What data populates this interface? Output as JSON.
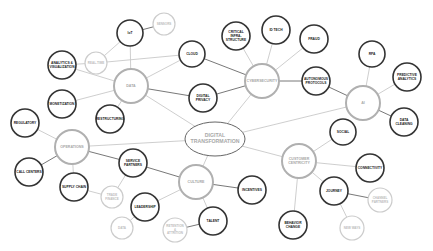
{
  "diagram": {
    "colors": {
      "dark_stroke": "#333333",
      "hub_stroke": "#b0b0b0",
      "light_stroke": "#cccccc",
      "dark_text": "#222222",
      "hub_text": "#a8a8a8",
      "light_text": "#bdbdbd",
      "edge": "#c8c8c8",
      "edge_dark": "#555555"
    },
    "center": {
      "id": "center",
      "label": [
        "DIGITAL",
        "TRANSFORMATION"
      ],
      "x": 215,
      "y": 139,
      "rx": 30,
      "ry": 17
    },
    "nodes": [
      {
        "id": "data",
        "label": [
          "DATA"
        ],
        "x": 131,
        "y": 86,
        "r": 17,
        "kind": "hub"
      },
      {
        "id": "cyber",
        "label": [
          "CYBERSECURITY"
        ],
        "x": 262,
        "y": 81,
        "r": 17,
        "kind": "hub"
      },
      {
        "id": "ai",
        "label": [
          "AI"
        ],
        "x": 363,
        "y": 103,
        "r": 17,
        "kind": "hub"
      },
      {
        "id": "ops",
        "label": [
          "OPERATIONS"
        ],
        "x": 72,
        "y": 147,
        "r": 17,
        "kind": "hub"
      },
      {
        "id": "culture",
        "label": [
          "CULTURE"
        ],
        "x": 196,
        "y": 182,
        "r": 17,
        "kind": "hub"
      },
      {
        "id": "cust",
        "label": [
          "CUSTOMER",
          "CENTRICITY"
        ],
        "x": 299,
        "y": 161,
        "r": 17,
        "kind": "hub"
      },
      {
        "id": "iot",
        "label": [
          "IoT"
        ],
        "x": 130,
        "y": 33,
        "r": 13,
        "kind": "dark"
      },
      {
        "id": "sensors",
        "label": [
          "SENSORS"
        ],
        "x": 164,
        "y": 24,
        "r": 11,
        "kind": "light"
      },
      {
        "id": "realtime",
        "label": [
          "REAL-TIME"
        ],
        "x": 96,
        "y": 63,
        "r": 11,
        "kind": "light"
      },
      {
        "id": "analytics",
        "label": [
          "ANALYTICS &",
          "VISUALIZATION"
        ],
        "x": 62,
        "y": 65,
        "r": 14,
        "kind": "dark"
      },
      {
        "id": "monet",
        "label": [
          "MONETIZATION"
        ],
        "x": 62,
        "y": 104,
        "r": 14,
        "kind": "dark"
      },
      {
        "id": "restr",
        "label": [
          "RESTRUCTURING"
        ],
        "x": 110,
        "y": 119,
        "r": 14,
        "kind": "dark"
      },
      {
        "id": "cloud",
        "label": [
          "CLOUD"
        ],
        "x": 192,
        "y": 54,
        "r": 13,
        "kind": "dark"
      },
      {
        "id": "privacy",
        "label": [
          "DIGITAL",
          "PRIVACY"
        ],
        "x": 203,
        "y": 98,
        "r": 14,
        "kind": "dark"
      },
      {
        "id": "critical",
        "label": [
          "CRITICAL",
          "INFRA-",
          "STRUCTURE"
        ],
        "x": 236,
        "y": 36,
        "r": 14,
        "kind": "dark"
      },
      {
        "id": "idtech",
        "label": [
          "ID TECH"
        ],
        "x": 276,
        "y": 30,
        "r": 14,
        "kind": "dark"
      },
      {
        "id": "fraud",
        "label": [
          "FRAUD"
        ],
        "x": 314,
        "y": 39,
        "r": 14,
        "kind": "dark"
      },
      {
        "id": "auto",
        "label": [
          "AUTONOMOUS",
          "PROTOCOLS"
        ],
        "x": 316,
        "y": 81,
        "r": 14,
        "kind": "dark"
      },
      {
        "id": "rpa",
        "label": [
          "RPA"
        ],
        "x": 372,
        "y": 54,
        "r": 13,
        "kind": "dark"
      },
      {
        "id": "predictive",
        "label": [
          "PREDICTIVE",
          "ANALYTICS"
        ],
        "x": 407,
        "y": 77,
        "r": 14,
        "kind": "dark"
      },
      {
        "id": "cleaning",
        "label": [
          "DATA",
          "CLEANING"
        ],
        "x": 404,
        "y": 122,
        "r": 14,
        "kind": "dark"
      },
      {
        "id": "regulatory",
        "label": [
          "REGULATORY"
        ],
        "x": 25,
        "y": 123,
        "r": 14,
        "kind": "dark"
      },
      {
        "id": "callcenters",
        "label": [
          "CALL CENTERS"
        ],
        "x": 29,
        "y": 172,
        "r": 14,
        "kind": "dark"
      },
      {
        "id": "supply",
        "label": [
          "SUPPLY CHAIN"
        ],
        "x": 74,
        "y": 187,
        "r": 14,
        "kind": "dark"
      },
      {
        "id": "trade",
        "label": [
          "TRADE",
          "FINANCE"
        ],
        "x": 112,
        "y": 197,
        "r": 11,
        "kind": "light"
      },
      {
        "id": "service",
        "label": [
          "SERVICE",
          "PARTNERS"
        ],
        "x": 133,
        "y": 163,
        "r": 14,
        "kind": "dark"
      },
      {
        "id": "leadership",
        "label": [
          "LEADERSHIP"
        ],
        "x": 145,
        "y": 207,
        "r": 14,
        "kind": "dark"
      },
      {
        "id": "datal",
        "label": [
          "DATA"
        ],
        "x": 122,
        "y": 228,
        "r": 11,
        "kind": "light"
      },
      {
        "id": "retention",
        "label": [
          "RETENTION",
          "&",
          "ATTRITION"
        ],
        "x": 175,
        "y": 230,
        "r": 12,
        "kind": "light"
      },
      {
        "id": "talent",
        "label": [
          "TALENT"
        ],
        "x": 213,
        "y": 221,
        "r": 14,
        "kind": "dark"
      },
      {
        "id": "incentives",
        "label": [
          "INCENTIVES"
        ],
        "x": 252,
        "y": 190,
        "r": 14,
        "kind": "dark"
      },
      {
        "id": "social",
        "label": [
          "SOCIAL"
        ],
        "x": 343,
        "y": 132,
        "r": 13,
        "kind": "dark"
      },
      {
        "id": "connectivity",
        "label": [
          "CONNECTIVITY"
        ],
        "x": 370,
        "y": 168,
        "r": 14,
        "kind": "dark"
      },
      {
        "id": "journey",
        "label": [
          "JOURNEY"
        ],
        "x": 334,
        "y": 191,
        "r": 14,
        "kind": "dark"
      },
      {
        "id": "channel",
        "label": [
          "CHANNEL",
          "PARTNERS"
        ],
        "x": 380,
        "y": 200,
        "r": 12,
        "kind": "light"
      },
      {
        "id": "newways",
        "label": [
          "NEW WAYS"
        ],
        "x": 352,
        "y": 228,
        "r": 12,
        "kind": "light"
      },
      {
        "id": "behavior",
        "label": [
          "BEHAVIOR",
          "CHANGE"
        ],
        "x": 293,
        "y": 225,
        "r": 14,
        "kind": "dark"
      }
    ],
    "edges": [
      [
        "center",
        "data",
        "light"
      ],
      [
        "center",
        "cyber",
        "light"
      ],
      [
        "center",
        "ai",
        "light"
      ],
      [
        "center",
        "ops",
        "light"
      ],
      [
        "center",
        "culture",
        "light"
      ],
      [
        "center",
        "cust",
        "light"
      ],
      [
        "data",
        "iot",
        "light"
      ],
      [
        "iot",
        "sensors",
        "dark"
      ],
      [
        "iot",
        "realtime",
        "light"
      ],
      [
        "realtime",
        "analytics",
        "light"
      ],
      [
        "realtime",
        "cloud",
        "light"
      ],
      [
        "data",
        "analytics",
        "light"
      ],
      [
        "data",
        "monet",
        "light"
      ],
      [
        "data",
        "restr",
        "light"
      ],
      [
        "data",
        "cloud",
        "light"
      ],
      [
        "data",
        "privacy",
        "dark"
      ],
      [
        "cyber",
        "cloud",
        "dark"
      ],
      [
        "cyber",
        "privacy",
        "dark"
      ],
      [
        "cyber",
        "critical",
        "light"
      ],
      [
        "cyber",
        "idtech",
        "light"
      ],
      [
        "cyber",
        "fraud",
        "light"
      ],
      [
        "cyber",
        "auto",
        "dark"
      ],
      [
        "auto",
        "ai",
        "dark"
      ],
      [
        "ai",
        "rpa",
        "light"
      ],
      [
        "ai",
        "predictive",
        "light"
      ],
      [
        "ai",
        "cleaning",
        "dark"
      ],
      [
        "ops",
        "regulatory",
        "light"
      ],
      [
        "ops",
        "callcenters",
        "dark"
      ],
      [
        "ops",
        "supply",
        "light"
      ],
      [
        "ops",
        "service",
        "dark"
      ],
      [
        "supply",
        "trade",
        "light"
      ],
      [
        "trade",
        "service",
        "light"
      ],
      [
        "culture",
        "service",
        "dark"
      ],
      [
        "culture",
        "leadership",
        "light"
      ],
      [
        "culture",
        "talent",
        "light"
      ],
      [
        "culture",
        "incentives",
        "dark"
      ],
      [
        "leadership",
        "datal",
        "light"
      ],
      [
        "talent",
        "retention",
        "dark"
      ],
      [
        "cust",
        "social",
        "light"
      ],
      [
        "cust",
        "connectivity",
        "light"
      ],
      [
        "cust",
        "journey",
        "light"
      ],
      [
        "cust",
        "behavior",
        "light"
      ],
      [
        "journey",
        "channel",
        "dark"
      ],
      [
        "journey",
        "newways",
        "light"
      ]
    ]
  }
}
